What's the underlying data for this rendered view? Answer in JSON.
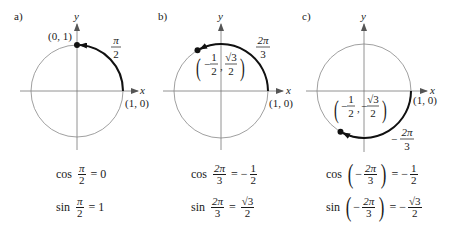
{
  "panels": [
    {
      "id": "a",
      "label": "a)",
      "axis_x": "x",
      "axis_y": "y",
      "start_point": "(1, 0)",
      "end_point": "(0, 1)",
      "arc_label": {
        "num": "π",
        "den": "2"
      },
      "equations": [
        {
          "fn": "cos",
          "arg_num": "π",
          "arg_den": "2",
          "eq": "=",
          "result": "0"
        },
        {
          "fn": "sin",
          "arg_num": "π",
          "arg_den": "2",
          "eq": "=",
          "result": "1"
        }
      ]
    },
    {
      "id": "b",
      "label": "b)",
      "axis_x": "x",
      "axis_y": "y",
      "start_point": "(1, 0)",
      "end_point": {
        "open": "(",
        "x_sign": "−",
        "x_num": "1",
        "x_den": "2",
        "sep": ",",
        "y_num": "√3",
        "y_den": "2",
        "close": ")"
      },
      "arc_label": {
        "num": "2π",
        "den": "3"
      },
      "equations": [
        {
          "fn": "cos",
          "arg_num": "2π",
          "arg_den": "3",
          "eq": "=",
          "sign": "−",
          "res_num": "1",
          "res_den": "2"
        },
        {
          "fn": "sin",
          "arg_num": "2π",
          "arg_den": "3",
          "eq": "=",
          "sign": "",
          "res_num": "√3",
          "res_den": "2"
        }
      ]
    },
    {
      "id": "c",
      "label": "c)",
      "axis_x": "x",
      "axis_y": "y",
      "start_point": "(1, 0)",
      "end_point": {
        "open": "(",
        "x_sign": "−",
        "x_num": "1",
        "x_den": "2",
        "sep": ",",
        "y_sign": "−",
        "y_num": "√3",
        "y_den": "2",
        "close": ")"
      },
      "arc_label": {
        "sign": "−",
        "num": "2π",
        "den": "3"
      },
      "equations": [
        {
          "fn": "cos",
          "open": "(",
          "arg_sign": "−",
          "arg_num": "2π",
          "arg_den": "3",
          "close": ")",
          "eq": "=",
          "sign": "−",
          "res_num": "1",
          "res_den": "2"
        },
        {
          "fn": "sin",
          "open": "(",
          "arg_sign": "−",
          "arg_num": "2π",
          "arg_den": "3",
          "close": ")",
          "eq": "=",
          "sign": "−",
          "res_num": "√3",
          "res_den": "2"
        }
      ]
    }
  ]
}
